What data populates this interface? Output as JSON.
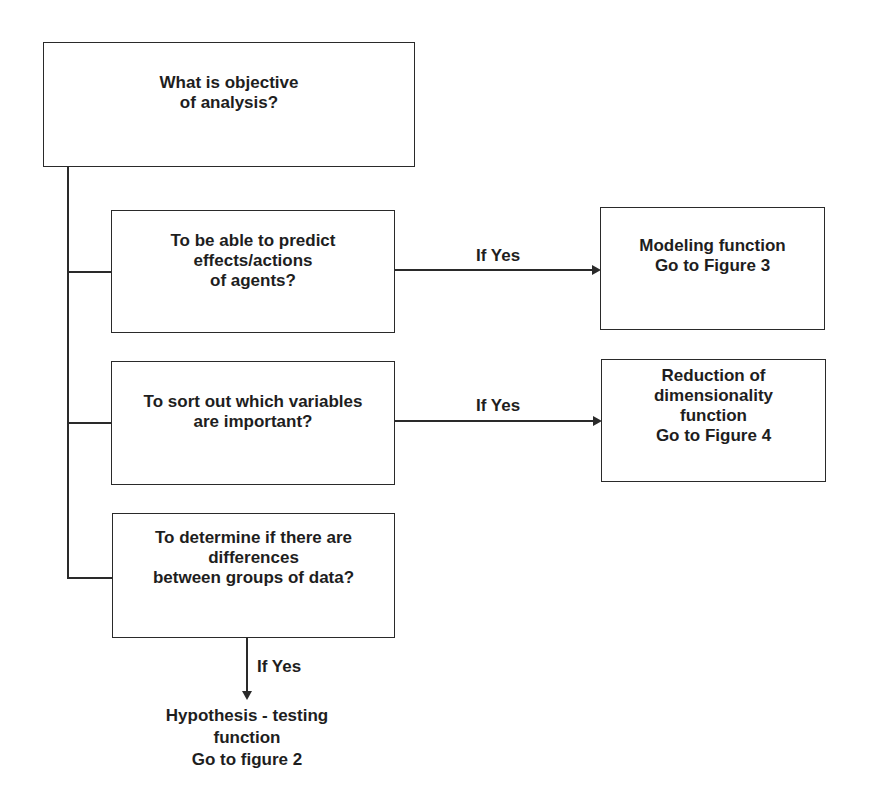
{
  "diagram": {
    "type": "flowchart",
    "root": {
      "lines": [
        "What is objective",
        "of analysis?"
      ]
    },
    "questions": [
      {
        "lines": [
          "To be able to predict",
          "effects/actions",
          "of agents?"
        ],
        "branch_label": "If Yes",
        "outcome": {
          "lines": [
            "Modeling function",
            "Go to Figure 3"
          ]
        }
      },
      {
        "lines": [
          "To sort out which variables",
          "are important?"
        ],
        "branch_label": "If Yes",
        "outcome": {
          "lines": [
            "Reduction of",
            "dimensionality",
            "function",
            "Go to Figure 4"
          ]
        }
      },
      {
        "lines": [
          "To determine if there are",
          "differences",
          "between groups of data?"
        ],
        "branch_label": "If Yes",
        "outcome": {
          "lines": [
            "Hypothesis - testing",
            "function",
            "Go to figure 2"
          ]
        }
      }
    ],
    "colors": {
      "stroke": "#2a2a2a",
      "text": "#1e1e1e",
      "background": "#ffffff"
    }
  }
}
